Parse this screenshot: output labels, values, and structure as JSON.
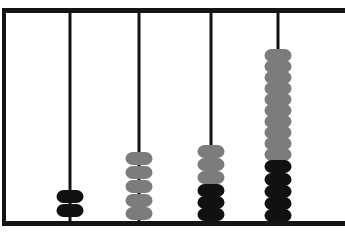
{
  "figure": {
    "kind": "abacus-bead-diagram",
    "background_color": "#ffffff",
    "frame_color": "#141414",
    "canvas_width": 345,
    "canvas_height": 233
  },
  "palette": {
    "black_bead": "#111111",
    "gray_bead": "#7c7c7c",
    "rod": "#141414",
    "frame": "#141414"
  },
  "chart_data": {
    "type": "bar",
    "title": "",
    "xlabel": "",
    "ylabel": "",
    "categories": [
      "Rod 1",
      "Rod 2",
      "Rod 3",
      "Rod 4"
    ],
    "series": [
      {
        "name": "Black beads",
        "values": [
          2,
          0,
          3,
          5
        ]
      },
      {
        "name": "Gray beads",
        "values": [
          0,
          5,
          3,
          10
        ]
      }
    ],
    "values": [
      2,
      5,
      6,
      15
    ],
    "grid": false,
    "legend": "none"
  },
  "rods": [
    {
      "name": "rod-1",
      "x": 70,
      "bead_count": 2,
      "beads": [
        {
          "color": "black",
          "y": 190
        },
        {
          "color": "black",
          "y": 204
        }
      ]
    },
    {
      "name": "rod-2",
      "x": 139,
      "bead_count": 5,
      "beads": [
        {
          "color": "gray",
          "y": 152
        },
        {
          "color": "gray",
          "y": 166
        },
        {
          "color": "gray",
          "y": 180
        },
        {
          "color": "gray",
          "y": 194
        },
        {
          "color": "gray",
          "y": 207
        }
      ]
    },
    {
      "name": "rod-3",
      "x": 211,
      "bead_count": 6,
      "beads": [
        {
          "color": "gray",
          "y": 145
        },
        {
          "color": "gray",
          "y": 158
        },
        {
          "color": "gray",
          "y": 171
        },
        {
          "color": "black",
          "y": 184
        },
        {
          "color": "black",
          "y": 196
        },
        {
          "color": "black",
          "y": 208
        }
      ]
    },
    {
      "name": "rod-4",
      "x": 278,
      "bead_count": 15,
      "beads": [
        {
          "color": "gray",
          "y": 49
        },
        {
          "color": "gray",
          "y": 60
        },
        {
          "color": "gray",
          "y": 71
        },
        {
          "color": "gray",
          "y": 82
        },
        {
          "color": "gray",
          "y": 93
        },
        {
          "color": "gray",
          "y": 104
        },
        {
          "color": "gray",
          "y": 115
        },
        {
          "color": "gray",
          "y": 126
        },
        {
          "color": "gray",
          "y": 137
        },
        {
          "color": "gray",
          "y": 148
        },
        {
          "color": "black",
          "y": 160
        },
        {
          "color": "black",
          "y": 173
        },
        {
          "color": "black",
          "y": 185
        },
        {
          "color": "black",
          "y": 197
        },
        {
          "color": "black",
          "y": 209
        }
      ]
    }
  ]
}
